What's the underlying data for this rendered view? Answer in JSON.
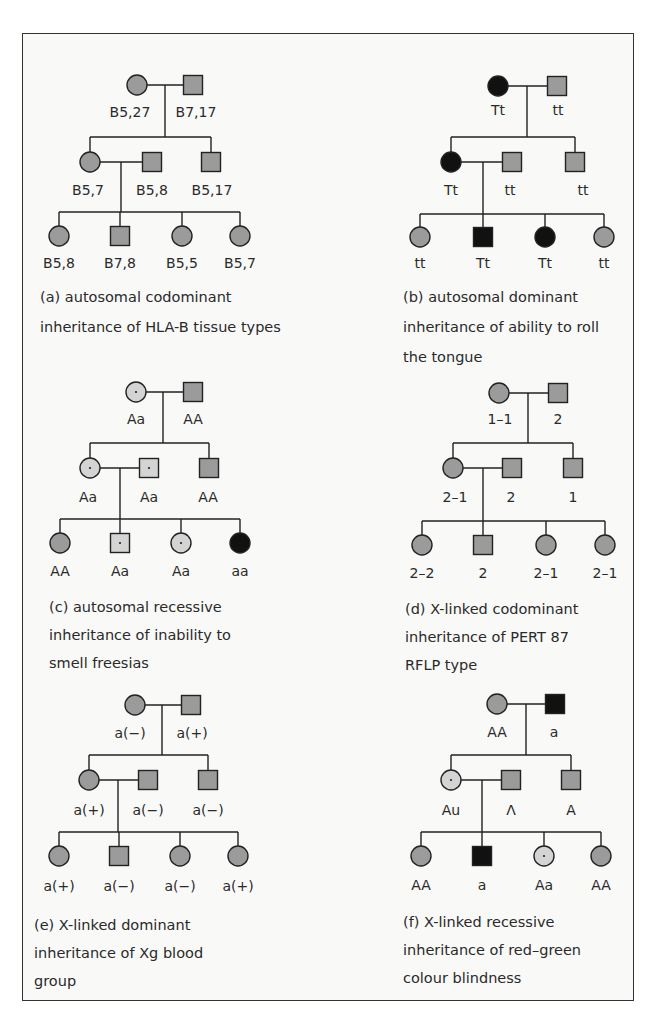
{
  "figure": {
    "colors": {
      "normal": "#9b9b9b",
      "affected": "#111111",
      "carrier": "#d4d4d4",
      "border": "#333333"
    },
    "panels": [
      {
        "id": "a",
        "caption": [
          "(a) autosomal  codominant",
          "inheritance of  HLA-B tissue types"
        ],
        "caption_pos": {
          "x": 40,
          "y": 302,
          "dy": 30
        },
        "gen1": {
          "drop_x": 165,
          "y": 85,
          "members": [
            {
              "sex": "female",
              "status": "normal",
              "x": 137,
              "label": "B5,27",
              "lx": 130,
              "ly": 117
            },
            {
              "sex": "male",
              "status": "normal",
              "x": 193,
              "label": "B7,17",
              "lx": 196,
              "ly": 117
            }
          ]
        },
        "gen2": {
          "sib_y": 137,
          "y": 162,
          "drop_x": 121,
          "members": [
            {
              "sex": "female",
              "status": "normal",
              "x": 90,
              "label": "B5,7",
              "lx": 88,
              "ly": 195
            },
            {
              "sex": "male",
              "status": "normal",
              "x": 152,
              "label": "B5,8",
              "lx": 152,
              "ly": 195,
              "spouse": true
            },
            {
              "sex": "male",
              "status": "normal",
              "x": 211,
              "label": "B5,17",
              "lx": 212,
              "ly": 195
            }
          ]
        },
        "gen3": {
          "sib_y": 212,
          "y": 236,
          "members": [
            {
              "sex": "female",
              "status": "normal",
              "x": 59,
              "label": "B5,8",
              "ly": 268
            },
            {
              "sex": "male",
              "status": "normal",
              "x": 120,
              "label": "B7,8",
              "ly": 268
            },
            {
              "sex": "female",
              "status": "normal",
              "x": 182,
              "label": "B5,5",
              "ly": 268
            },
            {
              "sex": "female",
              "status": "normal",
              "x": 240,
              "label": "B5,7",
              "ly": 268
            }
          ]
        }
      },
      {
        "id": "b",
        "caption": [
          "(b) autosomal  dominant",
          "inheritance of  ability to roll",
          "the tongue"
        ],
        "caption_pos": {
          "x": 403,
          "y": 302,
          "dy": 30
        },
        "gen1": {
          "drop_x": 527,
          "y": 86,
          "members": [
            {
              "sex": "female",
              "status": "affected",
              "x": 498,
              "label": "Tt",
              "lx": 498,
              "ly": 115
            },
            {
              "sex": "male",
              "status": "normal",
              "x": 557,
              "label": "tt",
              "lx": 558,
              "ly": 115
            }
          ]
        },
        "gen2": {
          "sib_y": 137,
          "y": 162,
          "drop_x": 483,
          "members": [
            {
              "sex": "female",
              "status": "affected",
              "x": 451,
              "label": "Tt",
              "lx": 451,
              "ly": 195
            },
            {
              "sex": "male",
              "status": "normal",
              "x": 512,
              "label": "tt",
              "lx": 510,
              "ly": 195,
              "spouse": true
            },
            {
              "sex": "male",
              "status": "normal",
              "x": 575,
              "label": "tt",
              "lx": 583,
              "ly": 195
            }
          ]
        },
        "gen3": {
          "sib_y": 214,
          "y": 237,
          "members": [
            {
              "sex": "female",
              "status": "normal",
              "x": 420,
              "label": "tt",
              "ly": 268
            },
            {
              "sex": "male",
              "status": "affected",
              "x": 483,
              "label": "Tt",
              "ly": 268
            },
            {
              "sex": "female",
              "status": "affected",
              "x": 545,
              "label": "Tt",
              "ly": 268
            },
            {
              "sex": "female",
              "status": "normal",
              "x": 604,
              "label": "tt",
              "ly": 268
            }
          ]
        }
      },
      {
        "id": "c",
        "caption": [
          "(c) autosomal recessive",
          "inheritance of inability to",
          "smell  freesias"
        ],
        "caption_pos": {
          "x": 49,
          "y": 612,
          "dy": 28
        },
        "gen1": {
          "drop_x": 163,
          "y": 392,
          "members": [
            {
              "sex": "female",
              "status": "carrier",
              "x": 136,
              "label": "Aa",
              "lx": 136,
              "ly": 424
            },
            {
              "sex": "male",
              "status": "normal",
              "x": 193,
              "label": "AA",
              "lx": 193,
              "ly": 424
            }
          ]
        },
        "gen2": {
          "sib_y": 443,
          "y": 468,
          "drop_x": 120,
          "members": [
            {
              "sex": "female",
              "status": "carrier",
              "x": 90,
              "label": "Aa",
              "lx": 88,
              "ly": 502
            },
            {
              "sex": "male",
              "status": "carrier",
              "x": 149,
              "label": "Aa",
              "lx": 149,
              "ly": 502,
              "spouse": true
            },
            {
              "sex": "male",
              "status": "normal",
              "x": 209,
              "label": "AA",
              "lx": 208,
              "ly": 502
            }
          ]
        },
        "gen3": {
          "sib_y": 519,
          "y": 543,
          "members": [
            {
              "sex": "female",
              "status": "normal",
              "x": 60,
              "label": "AA",
              "ly": 576
            },
            {
              "sex": "male",
              "status": "carrier",
              "x": 120,
              "label": "Aa",
              "ly": 576
            },
            {
              "sex": "female",
              "status": "carrier",
              "x": 181,
              "label": "Aa",
              "ly": 576
            },
            {
              "sex": "female",
              "status": "affected",
              "x": 240,
              "label": "aa",
              "ly": 576
            }
          ]
        }
      },
      {
        "id": "d",
        "caption": [
          "(d)  X-linked codominant",
          "inheritance of PERT 87",
          "RFLP type"
        ],
        "caption_pos": {
          "x": 405,
          "y": 614,
          "dy": 28
        },
        "gen1": {
          "drop_x": 528,
          "y": 393,
          "members": [
            {
              "sex": "female",
              "status": "normal",
              "x": 499,
              "label": "1–1",
              "lx": 500,
              "ly": 424
            },
            {
              "sex": "male",
              "status": "normal",
              "x": 558,
              "label": "2",
              "lx": 558,
              "ly": 424
            }
          ]
        },
        "gen2": {
          "sib_y": 443,
          "y": 468,
          "drop_x": 483,
          "members": [
            {
              "sex": "female",
              "status": "normal",
              "x": 453,
              "label": "2–1",
              "lx": 455,
              "ly": 502
            },
            {
              "sex": "male",
              "status": "normal",
              "x": 512,
              "label": "2",
              "lx": 511,
              "ly": 502,
              "spouse": true
            },
            {
              "sex": "male",
              "status": "normal",
              "x": 573,
              "label": "1",
              "lx": 573,
              "ly": 502
            }
          ]
        },
        "gen3": {
          "sib_y": 521,
          "y": 545,
          "members": [
            {
              "sex": "female",
              "status": "normal",
              "x": 422,
              "label": "2–2",
              "ly": 578
            },
            {
              "sex": "male",
              "status": "normal",
              "x": 483,
              "label": "2",
              "ly": 578
            },
            {
              "sex": "female",
              "status": "normal",
              "x": 546,
              "label": "2–1",
              "ly": 578
            },
            {
              "sex": "female",
              "status": "normal",
              "x": 605,
              "label": "2–1",
              "ly": 578
            }
          ]
        }
      },
      {
        "id": "e",
        "caption": [
          "(e)  X-linked dominant",
          "inheritance of Xg  blood",
          "group"
        ],
        "caption_pos": {
          "x": 34,
          "y": 930,
          "dy": 28
        },
        "gen1": {
          "drop_x": 162,
          "y": 705,
          "members": [
            {
              "sex": "female",
              "status": "normal",
              "x": 135,
              "label": "a(−)",
              "lx": 130,
              "ly": 738
            },
            {
              "sex": "male",
              "status": "normal",
              "x": 191,
              "label": "a(+)",
              "lx": 192,
              "ly": 738
            }
          ]
        },
        "gen2": {
          "sib_y": 755,
          "y": 780,
          "drop_x": 118,
          "members": [
            {
              "sex": "female",
              "status": "normal",
              "x": 89,
              "label": "a(+)",
              "lx": 89,
              "ly": 815
            },
            {
              "sex": "male",
              "status": "normal",
              "x": 148,
              "label": "a(−)",
              "lx": 148,
              "ly": 815,
              "spouse": true
            },
            {
              "sex": "male",
              "status": "normal",
              "x": 208,
              "label": "a(−)",
              "lx": 208,
              "ly": 815
            }
          ]
        },
        "gen3": {
          "sib_y": 832,
          "y": 856,
          "members": [
            {
              "sex": "female",
              "status": "normal",
              "x": 59,
              "label": "a(+)",
              "ly": 891
            },
            {
              "sex": "male",
              "status": "normal",
              "x": 119,
              "label": "a(−)",
              "ly": 891
            },
            {
              "sex": "female",
              "status": "normal",
              "x": 180,
              "label": "a(−)",
              "ly": 891
            },
            {
              "sex": "female",
              "status": "normal",
              "x": 238,
              "label": "a(+)",
              "ly": 891
            }
          ]
        }
      },
      {
        "id": "f",
        "caption": [
          "(f)  X-linked recessive",
          "inheritance of  red–green",
          "colour blindness"
        ],
        "caption_pos": {
          "x": 403,
          "y": 927,
          "dy": 28
        },
        "gen1": {
          "drop_x": 526,
          "y": 704,
          "members": [
            {
              "sex": "female",
              "status": "normal",
              "x": 497,
              "label": "AA",
              "lx": 497,
              "ly": 737
            },
            {
              "sex": "male",
              "status": "affected",
              "x": 555,
              "label": "a",
              "lx": 554,
              "ly": 737
            }
          ]
        },
        "gen2": {
          "sib_y": 755,
          "y": 780,
          "drop_x": 482,
          "members": [
            {
              "sex": "female",
              "status": "carrier",
              "x": 451,
              "label": "Au",
              "lx": 451,
              "ly": 815
            },
            {
              "sex": "male",
              "status": "normal",
              "x": 511,
              "label": "Λ",
              "lx": 511,
              "ly": 815,
              "spouse": true
            },
            {
              "sex": "male",
              "status": "normal",
              "x": 571,
              "label": "A",
              "lx": 571,
              "ly": 815
            }
          ]
        },
        "gen3": {
          "sib_y": 832,
          "y": 856,
          "members": [
            {
              "sex": "female",
              "status": "normal",
              "x": 421,
              "label": "AA",
              "ly": 890
            },
            {
              "sex": "male",
              "status": "affected",
              "x": 482,
              "label": "a",
              "ly": 890
            },
            {
              "sex": "female",
              "status": "carrier",
              "x": 544,
              "label": "Aa",
              "ly": 890
            },
            {
              "sex": "female",
              "status": "normal",
              "x": 601,
              "label": "AA",
              "ly": 890
            }
          ]
        }
      }
    ]
  }
}
